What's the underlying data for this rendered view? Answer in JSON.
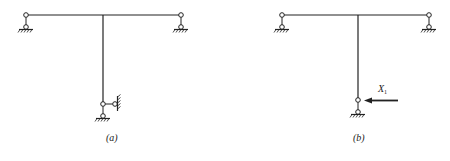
{
  "figures": [
    {
      "id": "a",
      "caption": "(a)",
      "description": "T-frame with pinned supports at beam ends; column base hinge with pin support and horizontal link to wall"
    },
    {
      "id": "b",
      "caption": "(b)",
      "description": "Primary structure: lateral link removed and replaced by redundant force X1"
    }
  ],
  "labels": {
    "caption_a": "(a)",
    "caption_b": "(b)",
    "force_symbol": "X",
    "force_subscript": "1"
  },
  "colors": {
    "line": "#222222",
    "background": "#ffffff"
  }
}
